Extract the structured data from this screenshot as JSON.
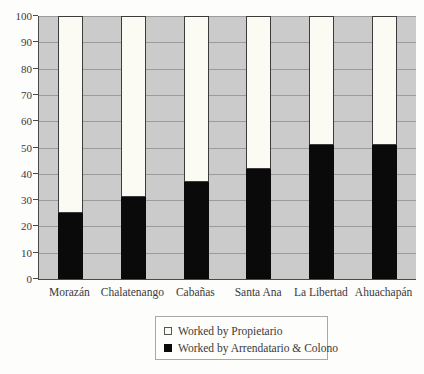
{
  "chart_data": {
    "type": "bar",
    "stacked": true,
    "title": "",
    "xlabel": "",
    "ylabel": "",
    "categories": [
      "Morazán",
      "Chalatenango",
      "Cabañas",
      "Santa Ana",
      "La Libertad",
      "Ahuachapán"
    ],
    "series": [
      {
        "name": "Worked by Propietario",
        "color": "#fbfbf4",
        "stack_position": "top",
        "values": [
          75,
          69,
          63,
          58,
          49,
          49
        ]
      },
      {
        "name": "Worked by Arrendatario & Colono",
        "color": "#0a0a0a",
        "stack_position": "bottom",
        "values": [
          25,
          31,
          37,
          42,
          51,
          51
        ]
      }
    ],
    "ylim": [
      0,
      100
    ],
    "yticks": [
      0,
      10,
      20,
      30,
      40,
      50,
      60,
      70,
      80,
      90,
      100
    ],
    "grid": true,
    "plot_background": "#cbcbcb",
    "gridline_color": "#9b9b9b",
    "legend_position": "bottom-center"
  }
}
